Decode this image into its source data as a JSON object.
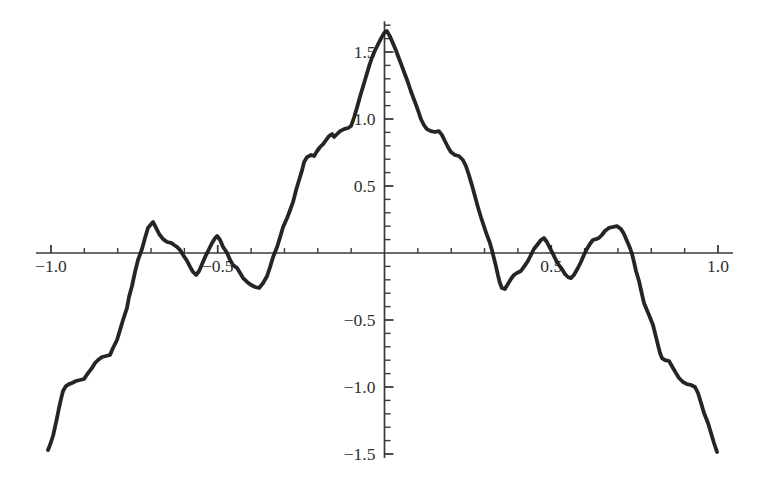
{
  "chart_data": {
    "type": "line",
    "title": "",
    "xlabel": "",
    "ylabel": "",
    "xlim": [
      -1.045,
      1.045
    ],
    "ylim": [
      -1.53,
      1.73
    ],
    "grid": false,
    "legend_position": "none",
    "axes": {
      "x_major_ticks": [
        -1.0,
        -0.5,
        0.5,
        1.0
      ],
      "x_major_labels": [
        "−1.0",
        "−0.5",
        "0.5",
        "1.0"
      ],
      "x_minor_step": 0.1,
      "y_major_ticks": [
        -1.5,
        -1.0,
        -0.5,
        0.5,
        1.0,
        1.5
      ],
      "y_major_labels": [
        "−1.5",
        "−1.0",
        "−0.5",
        "0.5",
        "1.0",
        "1.5"
      ],
      "y_minor_step": 0.1,
      "axis_color": "#3a3a3a",
      "tick_color": "#3a3a3a",
      "label_color": "#2e2e2e",
      "label_font_size": 17.5
    },
    "series": [
      {
        "name": "weierstrass-like-curve",
        "color": "#1c1c1c",
        "stroke_width": 3.8,
        "points": [
          [
            -1.009,
            -1.47
          ],
          [
            -1.003,
            -1.433
          ],
          [
            -0.994,
            -1.366
          ],
          [
            -0.988,
            -1.299
          ],
          [
            -0.982,
            -1.231
          ],
          [
            -0.976,
            -1.157
          ],
          [
            -0.97,
            -1.09
          ],
          [
            -0.964,
            -1.03
          ],
          [
            -0.955,
            -0.993
          ],
          [
            -0.946,
            -0.978
          ],
          [
            -0.937,
            -0.97
          ],
          [
            -0.925,
            -0.955
          ],
          [
            -0.913,
            -0.948
          ],
          [
            -0.901,
            -0.94
          ],
          [
            -0.889,
            -0.896
          ],
          [
            -0.877,
            -0.858
          ],
          [
            -0.868,
            -0.821
          ],
          [
            -0.859,
            -0.799
          ],
          [
            -0.847,
            -0.776
          ],
          [
            -0.835,
            -0.769
          ],
          [
            -0.823,
            -0.761
          ],
          [
            -0.814,
            -0.709
          ],
          [
            -0.802,
            -0.649
          ],
          [
            -0.793,
            -0.575
          ],
          [
            -0.784,
            -0.5
          ],
          [
            -0.772,
            -0.41
          ],
          [
            -0.766,
            -0.328
          ],
          [
            -0.757,
            -0.246
          ],
          [
            -0.748,
            -0.142
          ],
          [
            -0.739,
            -0.052
          ],
          [
            -0.727,
            0.03
          ],
          [
            -0.718,
            0.112
          ],
          [
            -0.709,
            0.187
          ],
          [
            -0.7,
            0.216
          ],
          [
            -0.694,
            0.231
          ],
          [
            -0.685,
            0.187
          ],
          [
            -0.676,
            0.142
          ],
          [
            -0.664,
            0.104
          ],
          [
            -0.652,
            0.082
          ],
          [
            -0.64,
            0.075
          ],
          [
            -0.631,
            0.06
          ],
          [
            -0.622,
            0.045
          ],
          [
            -0.613,
            0.022
          ],
          [
            -0.604,
            -0.015
          ],
          [
            -0.592,
            -0.06
          ],
          [
            -0.583,
            -0.104
          ],
          [
            -0.574,
            -0.142
          ],
          [
            -0.565,
            -0.164
          ],
          [
            -0.556,
            -0.134
          ],
          [
            -0.547,
            -0.082
          ],
          [
            -0.538,
            -0.03
          ],
          [
            -0.529,
            0.015
          ],
          [
            -0.517,
            0.075
          ],
          [
            -0.508,
            0.112
          ],
          [
            -0.502,
            0.127
          ],
          [
            -0.493,
            0.097
          ],
          [
            -0.484,
            0.045
          ],
          [
            -0.472,
            0.0
          ],
          [
            -0.463,
            -0.052
          ],
          [
            -0.454,
            -0.09
          ],
          [
            -0.442,
            -0.112
          ],
          [
            -0.433,
            -0.149
          ],
          [
            -0.424,
            -0.187
          ],
          [
            -0.412,
            -0.216
          ],
          [
            -0.4,
            -0.239
          ],
          [
            -0.388,
            -0.254
          ],
          [
            -0.376,
            -0.261
          ],
          [
            -0.364,
            -0.224
          ],
          [
            -0.352,
            -0.172
          ],
          [
            -0.343,
            -0.104
          ],
          [
            -0.334,
            -0.03
          ],
          [
            -0.322,
            0.045
          ],
          [
            -0.313,
            0.119
          ],
          [
            -0.304,
            0.194
          ],
          [
            -0.292,
            0.261
          ],
          [
            -0.283,
            0.321
          ],
          [
            -0.274,
            0.381
          ],
          [
            -0.265,
            0.47
          ],
          [
            -0.256,
            0.545
          ],
          [
            -0.247,
            0.619
          ],
          [
            -0.241,
            0.679
          ],
          [
            -0.232,
            0.716
          ],
          [
            -0.22,
            0.731
          ],
          [
            -0.211,
            0.724
          ],
          [
            -0.202,
            0.761
          ],
          [
            -0.193,
            0.791
          ],
          [
            -0.184,
            0.813
          ],
          [
            -0.175,
            0.843
          ],
          [
            -0.166,
            0.873
          ],
          [
            -0.157,
            0.888
          ],
          [
            -0.151,
            0.866
          ],
          [
            -0.142,
            0.888
          ],
          [
            -0.133,
            0.91
          ],
          [
            -0.121,
            0.925
          ],
          [
            -0.109,
            0.933
          ],
          [
            -0.1,
            0.948
          ],
          [
            -0.091,
            1.015
          ],
          [
            -0.082,
            1.09
          ],
          [
            -0.073,
            1.172
          ],
          [
            -0.064,
            1.246
          ],
          [
            -0.055,
            1.321
          ],
          [
            -0.046,
            1.396
          ],
          [
            -0.037,
            1.463
          ],
          [
            -0.028,
            1.515
          ],
          [
            -0.019,
            1.56
          ],
          [
            -0.01,
            1.604
          ],
          [
            -0.001,
            1.642
          ],
          [
            0.007,
            1.657
          ],
          [
            0.016,
            1.619
          ],
          [
            0.025,
            1.567
          ],
          [
            0.034,
            1.515
          ],
          [
            0.043,
            1.455
          ],
          [
            0.052,
            1.396
          ],
          [
            0.061,
            1.336
          ],
          [
            0.07,
            1.276
          ],
          [
            0.079,
            1.209
          ],
          [
            0.088,
            1.149
          ],
          [
            0.097,
            1.09
          ],
          [
            0.103,
            1.045
          ],
          [
            0.109,
            1.0
          ],
          [
            0.118,
            0.955
          ],
          [
            0.127,
            0.925
          ],
          [
            0.139,
            0.91
          ],
          [
            0.151,
            0.903
          ],
          [
            0.163,
            0.91
          ],
          [
            0.172,
            0.881
          ],
          [
            0.181,
            0.836
          ],
          [
            0.19,
            0.791
          ],
          [
            0.199,
            0.754
          ],
          [
            0.211,
            0.731
          ],
          [
            0.223,
            0.724
          ],
          [
            0.235,
            0.694
          ],
          [
            0.244,
            0.649
          ],
          [
            0.253,
            0.582
          ],
          [
            0.262,
            0.507
          ],
          [
            0.271,
            0.425
          ],
          [
            0.28,
            0.343
          ],
          [
            0.289,
            0.269
          ],
          [
            0.298,
            0.201
          ],
          [
            0.307,
            0.134
          ],
          [
            0.316,
            0.075
          ],
          [
            0.322,
            0.022
          ],
          [
            0.328,
            -0.037
          ],
          [
            0.334,
            -0.097
          ],
          [
            0.34,
            -0.164
          ],
          [
            0.346,
            -0.224
          ],
          [
            0.352,
            -0.261
          ],
          [
            0.361,
            -0.269
          ],
          [
            0.37,
            -0.231
          ],
          [
            0.379,
            -0.194
          ],
          [
            0.388,
            -0.164
          ],
          [
            0.397,
            -0.149
          ],
          [
            0.409,
            -0.134
          ],
          [
            0.418,
            -0.104
          ],
          [
            0.43,
            -0.06
          ],
          [
            0.439,
            -0.015
          ],
          [
            0.448,
            0.03
          ],
          [
            0.46,
            0.067
          ],
          [
            0.469,
            0.097
          ],
          [
            0.478,
            0.112
          ],
          [
            0.487,
            0.082
          ],
          [
            0.496,
            0.037
          ],
          [
            0.505,
            -0.007
          ],
          [
            0.514,
            -0.052
          ],
          [
            0.523,
            -0.09
          ],
          [
            0.532,
            -0.119
          ],
          [
            0.541,
            -0.157
          ],
          [
            0.55,
            -0.179
          ],
          [
            0.559,
            -0.187
          ],
          [
            0.568,
            -0.164
          ],
          [
            0.58,
            -0.112
          ],
          [
            0.589,
            -0.067
          ],
          [
            0.598,
            -0.015
          ],
          [
            0.607,
            0.03
          ],
          [
            0.616,
            0.067
          ],
          [
            0.625,
            0.097
          ],
          [
            0.634,
            0.104
          ],
          [
            0.643,
            0.112
          ],
          [
            0.652,
            0.134
          ],
          [
            0.661,
            0.164
          ],
          [
            0.673,
            0.187
          ],
          [
            0.685,
            0.194
          ],
          [
            0.697,
            0.201
          ],
          [
            0.709,
            0.179
          ],
          [
            0.718,
            0.142
          ],
          [
            0.727,
            0.09
          ],
          [
            0.736,
            0.037
          ],
          [
            0.742,
            -0.007
          ],
          [
            0.748,
            -0.067
          ],
          [
            0.754,
            -0.134
          ],
          [
            0.763,
            -0.209
          ],
          [
            0.769,
            -0.276
          ],
          [
            0.778,
            -0.373
          ],
          [
            0.793,
            -0.463
          ],
          [
            0.805,
            -0.537
          ],
          [
            0.814,
            -0.627
          ],
          [
            0.82,
            -0.687
          ],
          [
            0.826,
            -0.746
          ],
          [
            0.832,
            -0.784
          ],
          [
            0.841,
            -0.799
          ],
          [
            0.853,
            -0.806
          ],
          [
            0.865,
            -0.858
          ],
          [
            0.874,
            -0.896
          ],
          [
            0.883,
            -0.933
          ],
          [
            0.895,
            -0.963
          ],
          [
            0.907,
            -0.978
          ],
          [
            0.919,
            -0.985
          ],
          [
            0.931,
            -1.0
          ],
          [
            0.94,
            -1.045
          ],
          [
            0.949,
            -1.119
          ],
          [
            0.958,
            -1.194
          ],
          [
            0.97,
            -1.269
          ],
          [
            0.979,
            -1.343
          ],
          [
            0.988,
            -1.418
          ],
          [
            0.997,
            -1.485
          ]
        ]
      }
    ]
  }
}
